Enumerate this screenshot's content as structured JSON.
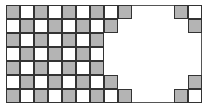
{
  "diagram": {
    "type": "mutilated-checkerboard-grid",
    "columns": 14,
    "rows": 7,
    "colors": {
      "shaded": "#b4b4b4",
      "unshaded": "#ffffff",
      "line": "#333333"
    },
    "shading_rule": "shaded when (row + col) is even",
    "visible_cells": [
      {
        "col": 0,
        "rows": [
          0,
          1,
          2,
          3,
          4,
          5,
          6
        ]
      },
      {
        "col": 1,
        "rows": [
          0,
          1,
          2,
          3,
          4,
          5,
          6
        ]
      },
      {
        "col": 2,
        "rows": [
          0,
          1,
          2,
          3,
          4,
          5,
          6
        ]
      },
      {
        "col": 3,
        "rows": [
          0,
          1,
          2,
          3,
          4,
          5,
          6
        ]
      },
      {
        "col": 4,
        "rows": [
          0,
          1,
          2,
          3,
          4,
          5,
          6
        ]
      },
      {
        "col": 5,
        "rows": [
          0,
          1,
          2,
          3,
          4,
          5,
          6
        ]
      },
      {
        "col": 6,
        "rows": [
          0,
          1,
          2,
          3,
          4,
          5,
          6
        ]
      },
      {
        "col": 7,
        "rows": [
          0,
          1,
          5,
          6
        ]
      },
      {
        "col": 8,
        "rows": [
          0,
          6
        ]
      },
      {
        "col": 12,
        "rows": [
          0,
          6
        ]
      },
      {
        "col": 13,
        "rows": [
          0,
          1,
          5,
          6
        ]
      }
    ]
  }
}
